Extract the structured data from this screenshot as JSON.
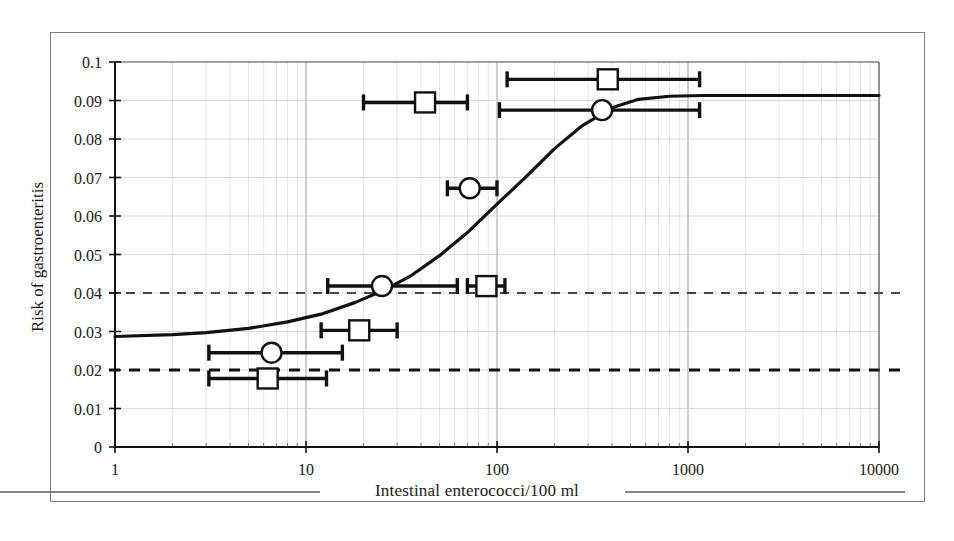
{
  "figure": {
    "kind": "scientific-figure",
    "background": "#ffffff",
    "frame_color": "#7d7d7d",
    "ink_color": "#111111"
  },
  "axes": {
    "y_title": "Risk of gastroenteritis",
    "x_title": "Intestinal enterococci/100 ml",
    "x_ticks": [
      "1",
      "10",
      "100",
      "1000",
      "10000"
    ],
    "y_ticks": [
      "0",
      "0.01",
      "0.02",
      "0.03",
      "0.04",
      "0.05",
      "0.06",
      "0.07",
      "0.08",
      "0.09",
      "0.1"
    ]
  },
  "chart_data": {
    "type": "line",
    "title": "",
    "xlabel": "Intestinal enterococci/100 ml",
    "ylabel": "Risk of gastroenteritis",
    "xscale": "log",
    "xlim": [
      1,
      10000
    ],
    "ylim": [
      0,
      0.1
    ],
    "grid": "minor-log-vertical-and-horizontal",
    "legend": "none",
    "series": [
      {
        "name": "Fitted dose-response curve",
        "type": "line",
        "marker": "none",
        "x": [
          1,
          2,
          3,
          5,
          8,
          12,
          18,
          25,
          35,
          50,
          70,
          100,
          140,
          200,
          280,
          400,
          550,
          800,
          1200,
          2000,
          4000,
          10000
        ],
        "y": [
          0.0287,
          0.0292,
          0.0297,
          0.0308,
          0.0325,
          0.0345,
          0.0375,
          0.0405,
          0.0443,
          0.0497,
          0.0557,
          0.0631,
          0.0699,
          0.0775,
          0.0835,
          0.0881,
          0.0903,
          0.0911,
          0.0913,
          0.0913,
          0.0913,
          0.0913
        ]
      },
      {
        "name": "Observed risk (square markers)",
        "type": "scatter-with-xerror",
        "marker": "open-square",
        "points": [
          {
            "x": 380,
            "y": 0.0955,
            "x_low": 113,
            "x_high": 1150
          },
          {
            "x": 42,
            "y": 0.0895,
            "x_low": 20,
            "x_high": 70
          },
          {
            "x": 88,
            "y": 0.0418,
            "x_low": 70,
            "x_high": 110
          },
          {
            "x": 19,
            "y": 0.0303,
            "x_low": 12,
            "x_high": 30
          },
          {
            "x": 6.3,
            "y": 0.0178,
            "x_low": 3.1,
            "x_high": 12.8
          }
        ]
      },
      {
        "name": "Observed risk (circle markers)",
        "type": "scatter-with-xerror",
        "marker": "open-circle",
        "points": [
          {
            "x": 355,
            "y": 0.0875,
            "x_low": 103,
            "x_high": 1150
          },
          {
            "x": 72,
            "y": 0.0672,
            "x_low": 55,
            "x_high": 100
          },
          {
            "x": 25,
            "y": 0.0418,
            "x_low": 13,
            "x_high": 62
          },
          {
            "x": 6.6,
            "y": 0.0245,
            "x_low": 3.1,
            "x_high": 15.5
          }
        ]
      }
    ],
    "reference_lines": [
      {
        "name": "upper-threshold",
        "y": 0.04,
        "style": "dashed-thin"
      },
      {
        "name": "lower-threshold",
        "y": 0.02,
        "style": "dashed-thick"
      }
    ]
  }
}
